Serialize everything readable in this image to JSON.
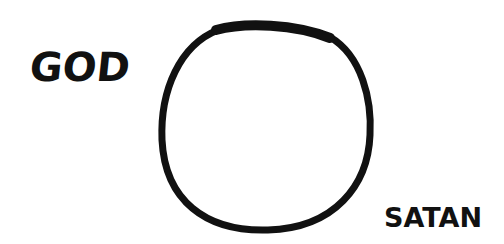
{
  "labels": {
    "left": "GOD",
    "right": "SATAN"
  },
  "shape": {
    "type": "circle-outline",
    "stroke_color": "#111111",
    "fill": "#ffffff"
  }
}
